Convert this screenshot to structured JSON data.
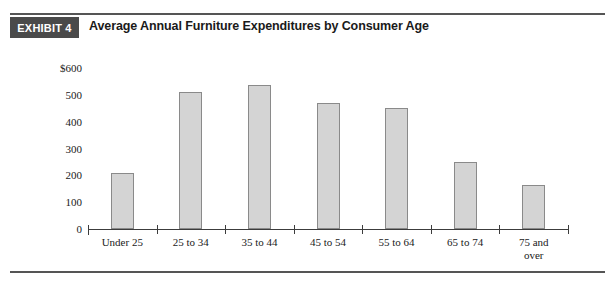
{
  "exhibit": {
    "badge_label": "EXHIBIT 4",
    "title": "Average Annual Furniture Expenditures by Consumer Age",
    "badge_color": "#4a4a4a",
    "rule_color": "#555555"
  },
  "chart_data": {
    "type": "bar",
    "title": "Average Annual Furniture Expenditures by Consumer Age",
    "xlabel": "",
    "ylabel": "",
    "categories": [
      "Under 25",
      "25 to 34",
      "35 to 44",
      "45 to 54",
      "55 to 64",
      "65 to 74",
      "75 and over"
    ],
    "values": [
      210,
      510,
      535,
      470,
      450,
      250,
      165
    ],
    "ylim": [
      0,
      600
    ],
    "ytick_values": [
      0,
      100,
      200,
      300,
      400,
      500,
      600
    ],
    "ytick_labels": [
      "0",
      "100",
      "200",
      "300",
      "400",
      "500",
      "$600"
    ],
    "grid": false,
    "legend": false,
    "bar_color": "#d4d4d4",
    "bar_border_color": "#8a8a8a",
    "axis_color": "#3c3c3c"
  }
}
